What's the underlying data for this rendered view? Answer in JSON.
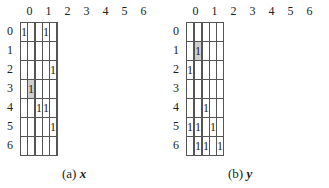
{
  "panels": [
    {
      "id": "a",
      "caption_label": "(a)",
      "caption_var": "x",
      "col_labels": [
        "0",
        "1",
        "2",
        "3",
        "4",
        "5",
        "6"
      ],
      "row_labels": [
        "0",
        "1",
        "2",
        "3",
        "4",
        "5",
        "6"
      ],
      "cells": [
        [
          "1",
          "",
          "",
          "",
          "1",
          "",
          ""
        ],
        [
          "",
          "",
          "",
          "",
          "",
          "",
          ""
        ],
        [
          "",
          "",
          "",
          "",
          "",
          "1",
          ""
        ],
        [
          "",
          "1",
          "",
          "",
          "",
          "",
          ""
        ],
        [
          "",
          "",
          "",
          "1",
          "1",
          "",
          ""
        ],
        [
          "",
          "",
          "",
          "",
          "",
          "1",
          ""
        ],
        [
          "",
          "",
          "",
          "",
          "",
          "",
          ""
        ]
      ],
      "shaded": [
        [
          3,
          1
        ]
      ]
    },
    {
      "id": "b",
      "caption_label": "(b)",
      "caption_var": "y",
      "col_labels": [
        "0",
        "1",
        "2",
        "3",
        "4",
        "5",
        "6"
      ],
      "row_labels": [
        "0",
        "1",
        "2",
        "3",
        "4",
        "5",
        "6"
      ],
      "cells": [
        [
          "",
          "",
          "",
          "",
          "",
          "",
          ""
        ],
        [
          "",
          "",
          "1",
          "",
          "",
          "",
          ""
        ],
        [
          "1",
          "",
          "",
          "",
          "",
          "",
          ""
        ],
        [
          "",
          "",
          "",
          "",
          "",
          "",
          ""
        ],
        [
          "",
          "",
          "",
          "",
          "1",
          "",
          ""
        ],
        [
          "1",
          "",
          "1",
          "",
          "",
          "1",
          ""
        ],
        [
          "",
          "",
          "1",
          "",
          "1",
          "",
          "1"
        ]
      ],
      "shaded": [
        [
          1,
          2
        ]
      ]
    }
  ],
  "colors": {
    "shade": "#cfcfcf",
    "border": "#555555"
  }
}
